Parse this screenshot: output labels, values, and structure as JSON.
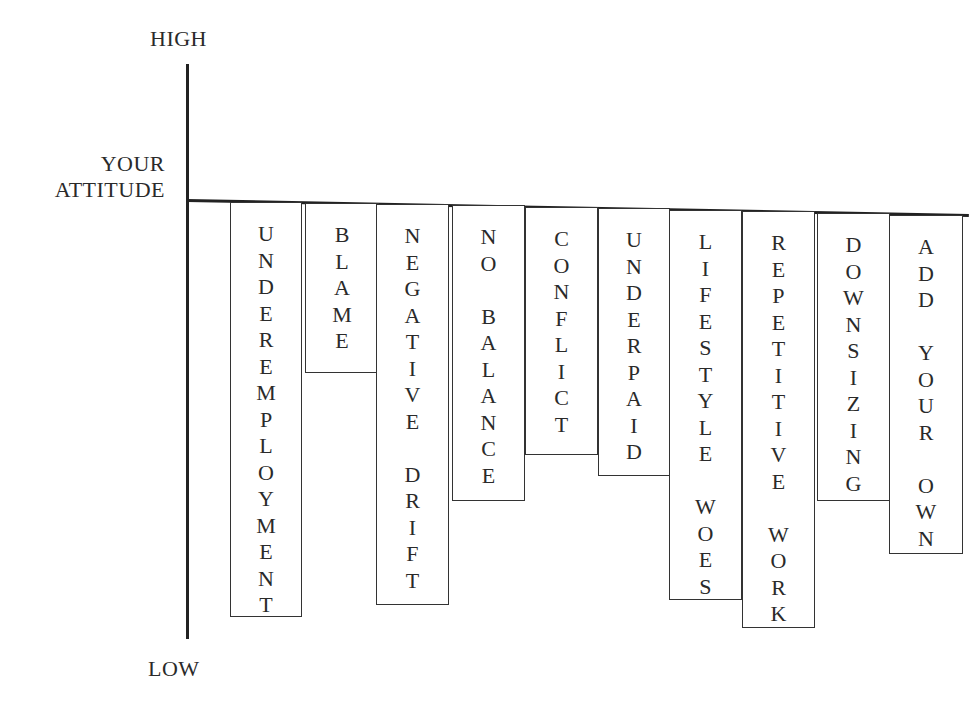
{
  "axis": {
    "top_label": "HIGH",
    "middle_label_line1": "YOUR",
    "middle_label_line2": "ATTITUDE",
    "bottom_label": "LOW"
  },
  "chart_data": {
    "type": "bar",
    "orientation": "hanging-down-from-attitude-line",
    "title": "",
    "ylabel": "Your Attitude (High to Low)",
    "categories": [
      "UNDEREMPLOYMENT",
      "BLAME",
      "NEGATIVE DRIFT",
      "NO BALANCE",
      "CONFLICT",
      "UNDERPAID",
      "LIFESTYLE WOES",
      "REPETITIVE WORK",
      "DOWNSIZING",
      "ADD YOUR OWN"
    ],
    "values_px_depth_below_line": [
      415,
      170,
      402,
      297,
      250,
      270,
      390,
      416,
      288,
      340
    ],
    "grid": false,
    "legend": false
  },
  "bars": [
    {
      "label": "UNDEREMPLOYMENT",
      "lines": [
        "UNDEREMPLOYMENT"
      ],
      "left": 230,
      "top": 202,
      "width": 72,
      "height": 415
    },
    {
      "label": "BLAME",
      "lines": [
        "BLAME"
      ],
      "left": 305,
      "top": 203,
      "width": 74,
      "height": 170
    },
    {
      "label": "NEGATIVE DRIFT",
      "lines": [
        "NEGATIVE",
        "DRIFT"
      ],
      "left": 376,
      "top": 204,
      "width": 73,
      "height": 401
    },
    {
      "label": "NO BALANCE",
      "lines": [
        "NO",
        "BALANCE"
      ],
      "left": 452,
      "top": 205,
      "width": 73,
      "height": 296
    },
    {
      "label": "CONFLICT",
      "lines": [
        "CONFLICT"
      ],
      "left": 525,
      "top": 207,
      "width": 73,
      "height": 248
    },
    {
      "label": "UNDERPAID",
      "lines": [
        "UNDERPAID"
      ],
      "left": 598,
      "top": 208,
      "width": 72,
      "height": 268
    },
    {
      "label": "LIFESTYLE WOES",
      "lines": [
        "LIFESTYLE",
        "WOES"
      ],
      "left": 669,
      "top": 210,
      "width": 73,
      "height": 390
    },
    {
      "label": "REPETITIVE WORK",
      "lines": [
        "REPETITIVE",
        "WORK"
      ],
      "left": 742,
      "top": 211,
      "width": 73,
      "height": 417
    },
    {
      "label": "DOWNSIZING",
      "lines": [
        "DOWNSIZING"
      ],
      "left": 817,
      "top": 213,
      "width": 73,
      "height": 288
    },
    {
      "label": "ADD YOUR OWN",
      "lines": [
        "ADD",
        "YOUR",
        "OWN"
      ],
      "left": 889,
      "top": 215,
      "width": 74,
      "height": 339
    }
  ]
}
